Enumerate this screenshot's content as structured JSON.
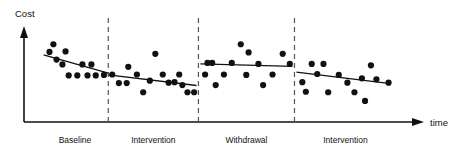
{
  "chart_data": {
    "type": "scatter",
    "title": "",
    "subtitle": "",
    "xlabel": "time",
    "ylabel": "Cost",
    "xlim": [
      0,
      100
    ],
    "ylim": [
      0,
      100
    ],
    "grid": false,
    "legend": "none",
    "annotations": [
      "Dashed vertical lines separate the four phases of an ABAB reversal design.",
      "Each phase has a fitted trend line over its scattered data points."
    ],
    "phases": [
      {
        "name": "Baseline",
        "label": "Baseline",
        "x_range": [
          4.5,
          21.5
        ],
        "divider_after": true,
        "trend": {
          "x1": 5.0,
          "y1": 70.0,
          "x2": 21.5,
          "y2": 51.0
        },
        "points": [
          {
            "x": 6.5,
            "y": 73.0
          },
          {
            "x": 8.3,
            "y": 65.0
          },
          {
            "x": 7.5,
            "y": 81.0
          },
          {
            "x": 9.8,
            "y": 60.0
          },
          {
            "x": 10.6,
            "y": 73.5
          },
          {
            "x": 11.4,
            "y": 48.5
          },
          {
            "x": 13.6,
            "y": 48.5
          },
          {
            "x": 14.9,
            "y": 60.0
          },
          {
            "x": 16.2,
            "y": 48.5
          },
          {
            "x": 17.2,
            "y": 60.0
          },
          {
            "x": 18.3,
            "y": 48.5
          },
          {
            "x": 20.4,
            "y": 49.0
          }
        ]
      },
      {
        "name": "Intervention-1",
        "label": "Intervention",
        "x_range": [
          21.5,
          44.5
        ],
        "divider_after": true,
        "trend": {
          "x1": 21.5,
          "y1": 49.0,
          "x2": 44.0,
          "y2": 38.0
        },
        "points": [
          {
            "x": 22.5,
            "y": 49.5
          },
          {
            "x": 24.2,
            "y": 40.5
          },
          {
            "x": 26.2,
            "y": 40.5
          },
          {
            "x": 26.6,
            "y": 57.5
          },
          {
            "x": 28.8,
            "y": 49.5
          },
          {
            "x": 30.4,
            "y": 31.0
          },
          {
            "x": 32.1,
            "y": 43.0
          },
          {
            "x": 33.5,
            "y": 71.0
          },
          {
            "x": 35.4,
            "y": 49.5
          },
          {
            "x": 36.9,
            "y": 41.0
          },
          {
            "x": 38.4,
            "y": 41.5
          },
          {
            "x": 39.6,
            "y": 49.5
          },
          {
            "x": 40.4,
            "y": 38.5
          },
          {
            "x": 41.7,
            "y": 31.0
          },
          {
            "x": 43.4,
            "y": 31.0
          }
        ]
      },
      {
        "name": "Withdrawal",
        "label": "Withdrawal",
        "x_range": [
          44.5,
          69.0
        ],
        "divider_after": true,
        "trend": {
          "x1": 45.0,
          "y1": 60.5,
          "x2": 68.5,
          "y2": 58.0
        },
        "points": [
          {
            "x": 46.8,
            "y": 61.5
          },
          {
            "x": 48.0,
            "y": 61.5
          },
          {
            "x": 46.2,
            "y": 49.5
          },
          {
            "x": 48.9,
            "y": 38.5
          },
          {
            "x": 51.0,
            "y": 49.5
          },
          {
            "x": 53.0,
            "y": 61.5
          },
          {
            "x": 55.3,
            "y": 81.0
          },
          {
            "x": 57.3,
            "y": 72.5
          },
          {
            "x": 56.7,
            "y": 49.0
          },
          {
            "x": 59.8,
            "y": 60.5
          },
          {
            "x": 61.0,
            "y": 38.5
          },
          {
            "x": 63.4,
            "y": 49.5
          },
          {
            "x": 66.0,
            "y": 71.0
          },
          {
            "x": 67.8,
            "y": 60.5
          }
        ]
      },
      {
        "name": "Intervention-2",
        "label": "Intervention",
        "x_range": [
          69.0,
          95.0
        ],
        "divider_after": false,
        "trend": {
          "x1": 69.5,
          "y1": 52.0,
          "x2": 93.5,
          "y2": 40.0
        },
        "points": [
          {
            "x": 71.0,
            "y": 41.5
          },
          {
            "x": 73.4,
            "y": 60.5
          },
          {
            "x": 76.4,
            "y": 60.5
          },
          {
            "x": 74.8,
            "y": 50.0
          },
          {
            "x": 77.6,
            "y": 31.0
          },
          {
            "x": 71.9,
            "y": 31.5
          },
          {
            "x": 80.3,
            "y": 49.0
          },
          {
            "x": 82.5,
            "y": 41.0
          },
          {
            "x": 84.3,
            "y": 31.0
          },
          {
            "x": 86.2,
            "y": 45.5
          },
          {
            "x": 88.5,
            "y": 59.0
          },
          {
            "x": 89.9,
            "y": 44.5
          },
          {
            "x": 87.0,
            "y": 22.0
          },
          {
            "x": 93.0,
            "y": 41.0
          }
        ]
      }
    ],
    "dividers": [
      21.5,
      44.5,
      69.0
    ],
    "axis": {
      "y_arrow": true,
      "x_arrow": true
    },
    "marker": {
      "shape": "circle",
      "color": "#111111",
      "size": 3.1
    },
    "trend_line_color": "#111111",
    "divider_color": "#555555"
  }
}
